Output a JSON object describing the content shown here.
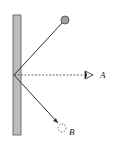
{
  "diagram": {
    "type": "plane mirror reflection",
    "labels": {
      "eye": "A",
      "image": "B"
    },
    "colors": {
      "mirror": "#b4b4b4",
      "ball": "#a0a0a0",
      "line": "#333333"
    }
  }
}
